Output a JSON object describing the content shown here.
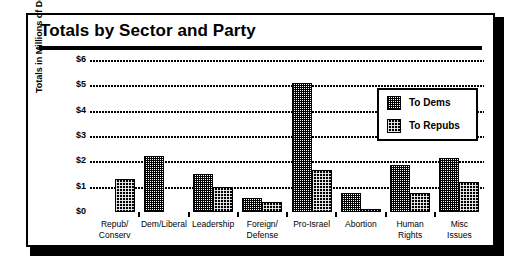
{
  "figure": {
    "title": "Totals by Sector and Party"
  },
  "legend": {
    "position": "inside-top-right",
    "entries": [
      {
        "label": "To Dems",
        "pattern": "light-checker"
      },
      {
        "label": "To Repubs",
        "pattern": "dark-dither"
      }
    ]
  },
  "chart_data": {
    "type": "bar",
    "title": "Totals by Sector and Party",
    "xlabel": "",
    "ylabel": "Totals in Millions of Dollars",
    "categories": [
      "Repub/\nConserv",
      "Dem/Liberal",
      "Leadership",
      "Foreign/\nDefense",
      "Pro-Israel",
      "Abortion",
      "Human\nRights",
      "Misc Issues"
    ],
    "series": [
      {
        "name": "To Dems",
        "values": [
          0.02,
          2.2,
          1.5,
          0.55,
          5.1,
          0.75,
          1.85,
          2.15
        ]
      },
      {
        "name": "To Repubs",
        "values": [
          1.3,
          0.03,
          1.0,
          0.4,
          1.65,
          0.1,
          0.75,
          1.2
        ]
      }
    ],
    "ylim": [
      0,
      6
    ],
    "yticks": [
      0,
      1,
      2,
      3,
      4,
      5,
      6
    ],
    "ytick_labels": [
      "$0",
      "$1",
      "$2",
      "$3",
      "$4",
      "$5",
      "$6"
    ],
    "grid": true,
    "grid_style": "dotted-horizontal",
    "units": "millions of dollars"
  }
}
